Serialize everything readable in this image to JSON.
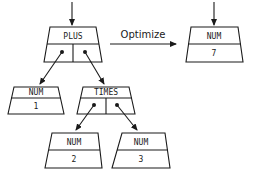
{
  "diagram": {
    "title": "",
    "transform_label": "Optimize",
    "before_tree": {
      "root": {
        "label": "PLUS",
        "type": "operator"
      },
      "left": {
        "label": "NUM",
        "value": "1"
      },
      "right": {
        "label": "TIMES",
        "type": "operator",
        "left": {
          "label": "NUM",
          "value": "2"
        },
        "right": {
          "label": "NUM",
          "value": "3"
        }
      }
    },
    "after_tree": {
      "root": {
        "label": "NUM",
        "value": "7"
      }
    }
  },
  "colors": {
    "stroke": "#1a1a1a",
    "fill": "#ffffff",
    "background": "#ffffff"
  }
}
